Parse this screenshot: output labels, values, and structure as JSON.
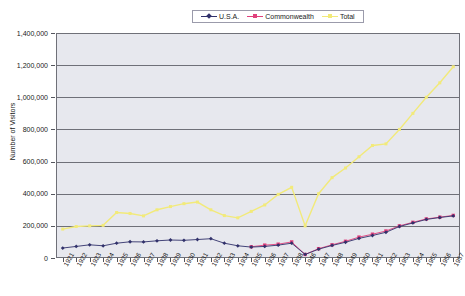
{
  "chart_data": {
    "type": "line",
    "title": "",
    "xlabel": "",
    "ylabel": "Number of Visitors",
    "ylim": [
      0,
      1400000
    ],
    "ytick_values": [
      1400000,
      1200000,
      1000000,
      800000,
      600000,
      400000,
      200000,
      0
    ],
    "ytick_labels": [
      "1,400,000",
      "1,200,000",
      "1,000,000",
      "800,000",
      "600,000",
      "400,000",
      "200,000",
      "0"
    ],
    "grid": true,
    "legend_position": "top-center",
    "categories": [
      "1921",
      "1922",
      "1923",
      "1924",
      "1925",
      "1926",
      "1927",
      "1928",
      "1929",
      "1930",
      "1931",
      "1932",
      "1933",
      "1934",
      "1935",
      "1936",
      "1937",
      "1938",
      "1946",
      "1947",
      "1948",
      "1949",
      "1950",
      "1951",
      "1952",
      "1953",
      "1954",
      "1955",
      "1956",
      "1957"
    ],
    "series": [
      {
        "name": "U.S.A.",
        "color": "#31316b",
        "marker": "diamond",
        "values": [
          62000,
          72000,
          82000,
          76000,
          92000,
          101000,
          100000,
          107000,
          112000,
          110000,
          115000,
          120000,
          92000,
          76000,
          68000,
          72000,
          80000,
          92000,
          22000,
          55000,
          78000,
          98000,
          122000,
          140000,
          160000,
          196000,
          218000,
          240000,
          252000,
          262000
        ]
      },
      {
        "name": "Commonwealth",
        "color": "#e0407c",
        "marker": "square",
        "values": [
          null,
          null,
          null,
          null,
          null,
          null,
          null,
          null,
          null,
          null,
          null,
          null,
          null,
          null,
          70000,
          80000,
          86000,
          100000,
          22000,
          58000,
          82000,
          104000,
          130000,
          148000,
          168000,
          200000,
          222000,
          243000,
          254000,
          265000
        ]
      },
      {
        "name": "Total",
        "color": "#f2ea7a",
        "marker": "square",
        "values": [
          180000,
          196000,
          200000,
          203000,
          283000,
          277000,
          262000,
          300000,
          320000,
          338000,
          348000,
          300000,
          264000,
          250000,
          290000,
          330000,
          396000,
          440000,
          200000,
          400000,
          500000,
          560000,
          630000,
          700000,
          710000,
          800000,
          900000,
          1000000,
          1090000,
          1190000
        ]
      }
    ]
  },
  "legend": {
    "items": [
      {
        "label": "U.S.A.",
        "color": "#31316b",
        "marker": "diamond"
      },
      {
        "label": "Commonwealth",
        "color": "#e0407c",
        "marker": "square"
      },
      {
        "label": "Total",
        "color": "#f2ea7a",
        "marker": "square"
      }
    ]
  }
}
